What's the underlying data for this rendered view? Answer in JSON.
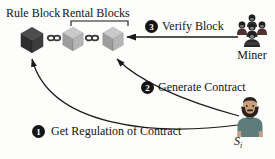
{
  "diagram": {
    "title_context": "blockchain contract workflow",
    "block_labels": {
      "rule_block": "Rule Block",
      "rental_blocks": "Rental Blocks"
    },
    "steps": [
      {
        "num": "1",
        "label": "Get Regulation of Contract"
      },
      {
        "num": "2",
        "label": "Generate Contract"
      },
      {
        "num": "3",
        "label": "Verify Block"
      }
    ],
    "actors": {
      "miner": {
        "label": "Miner"
      },
      "subscriber": {
        "symbol": "S",
        "subscript": "i"
      }
    },
    "icons": [
      "cube-icon",
      "chain-link-icon",
      "miner-group-icon",
      "person-icon",
      "arrow"
    ],
    "colors": {
      "rule_cube_top": "#4d4d4d",
      "rule_cube_left": "#2e2e2e",
      "rule_cube_right": "#3c3c3c",
      "rental_cube_top": "#c9c9c9",
      "rental_cube_left": "#9d9d9d",
      "rental_cube_right": "#b5b5b5",
      "link": "#3a3a3a",
      "arrow": "#1a1a1a",
      "badge_bg": "#141414",
      "badge_text": "#ffffff",
      "miner_body": "#2e2e2e",
      "miner_accent": "#52302e",
      "skin": "#c9a07b",
      "hair_beard": "#2a211c",
      "shirt": "#5f7c7c"
    }
  }
}
